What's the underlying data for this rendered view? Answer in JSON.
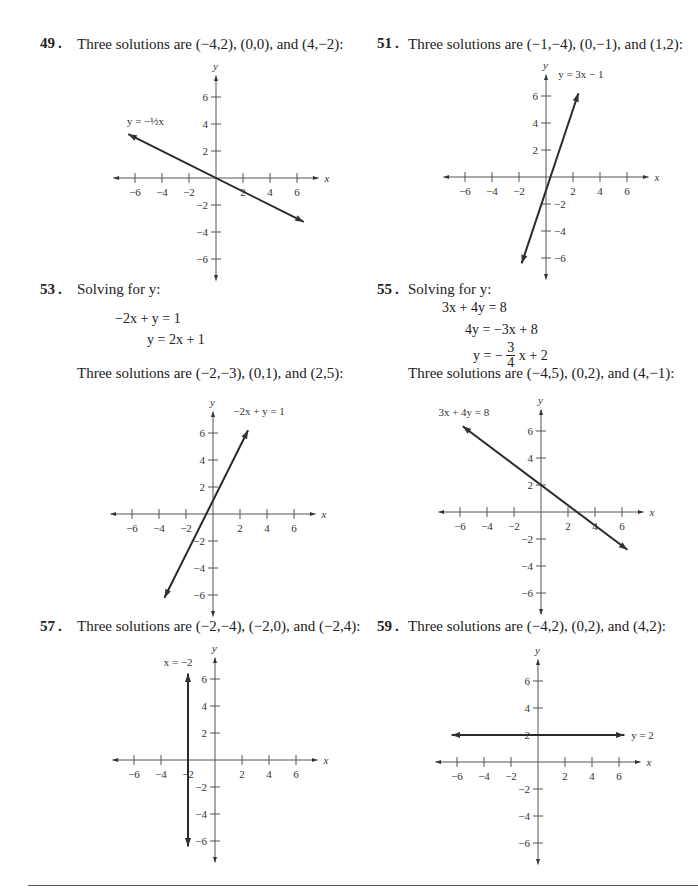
{
  "problems": [
    {
      "number": "49",
      "statement": "Three solutions are (−4,2), (0,0), and (4,−2):",
      "steps": [],
      "graph": {
        "line_label": "y = −½x",
        "equation": "y = -1/2 x",
        "points": [
          [
            -4,
            2
          ],
          [
            0,
            0
          ],
          [
            4,
            -2
          ]
        ]
      }
    },
    {
      "number": "51",
      "statement": "Three solutions are (−1,−4), (0,−1), and (1,2):",
      "steps": [],
      "graph": {
        "line_label": "y = 3x − 1",
        "equation": "y = 3x - 1",
        "points": [
          [
            -1,
            -4
          ],
          [
            0,
            -1
          ],
          [
            1,
            2
          ]
        ]
      }
    },
    {
      "number": "53",
      "intro": "Solving for y:",
      "steps": [
        "−2x + y = 1",
        "y = 2x + 1"
      ],
      "statement": "Three solutions are (−2,−3), (0,1), and (2,5):",
      "graph": {
        "line_label": "−2x + y = 1",
        "equation": "y = 2x + 1",
        "points": [
          [
            -2,
            -3
          ],
          [
            0,
            1
          ],
          [
            2,
            5
          ]
        ]
      }
    },
    {
      "number": "55",
      "intro": "Solving for y:",
      "steps": [
        "3x + 4y = 8",
        "4y = −3x + 8",
        "y = −",
        "3",
        "4",
        "x + 2"
      ],
      "statement": "Three solutions are (−4,5), (0,2), and (4,−1):",
      "graph": {
        "line_label": "3x + 4y = 8",
        "equation": "y = -3/4 x + 2",
        "points": [
          [
            -4,
            5
          ],
          [
            0,
            2
          ],
          [
            4,
            -1
          ]
        ]
      }
    },
    {
      "number": "57",
      "statement": "Three solutions are (−2,−4), (−2,0), and (−2,4):",
      "steps": [],
      "graph": {
        "line_label": "x = −2",
        "equation": "x = -2",
        "points": [
          [
            -2,
            -4
          ],
          [
            -2,
            0
          ],
          [
            -2,
            4
          ]
        ]
      }
    },
    {
      "number": "59",
      "statement": "Three solutions are (−4,2), (0,2), and (4,2):",
      "steps": [],
      "graph": {
        "line_label": "y = 2",
        "equation": "y = 2",
        "points": [
          [
            -4,
            2
          ],
          [
            0,
            2
          ],
          [
            4,
            2
          ]
        ]
      }
    }
  ],
  "axes": {
    "x_label": "x",
    "y_label": "y",
    "x_ticks": [
      "−6",
      "−4",
      "−2",
      "2",
      "4",
      "6"
    ],
    "y_ticks": [
      "6",
      "4",
      "2",
      "−2",
      "−4",
      "−6"
    ]
  },
  "chart_data": [
    {
      "type": "line",
      "title": "49",
      "series": [
        {
          "name": "y = -1/2 x",
          "x": [
            -6.5,
            6.5
          ],
          "y": [
            3.25,
            -3.25
          ]
        }
      ],
      "xlim": [
        -7,
        7
      ],
      "ylim": [
        -7,
        7
      ],
      "grid": false
    },
    {
      "type": "line",
      "title": "51",
      "series": [
        {
          "name": "y = 3x - 1",
          "x": [
            -1.8,
            2.4
          ],
          "y": [
            -6.4,
            6.2
          ]
        }
      ],
      "xlim": [
        -7,
        7
      ],
      "ylim": [
        -7,
        7
      ],
      "grid": false
    },
    {
      "type": "line",
      "title": "53",
      "series": [
        {
          "name": "-2x + y = 1",
          "x": [
            -3.6,
            2.6
          ],
          "y": [
            -6.2,
            6.2
          ]
        }
      ],
      "xlim": [
        -7,
        7
      ],
      "ylim": [
        -7,
        7
      ],
      "grid": false
    },
    {
      "type": "line",
      "title": "55",
      "series": [
        {
          "name": "3x + 4y = 8",
          "x": [
            -5.8,
            6.4
          ],
          "y": [
            6.35,
            -2.8
          ]
        }
      ],
      "xlim": [
        -7,
        7
      ],
      "ylim": [
        -7,
        7
      ],
      "grid": false
    },
    {
      "type": "line",
      "title": "57",
      "series": [
        {
          "name": "x = -2",
          "x": [
            -2,
            -2
          ],
          "y": [
            -6.4,
            6.4
          ]
        }
      ],
      "xlim": [
        -7,
        7
      ],
      "ylim": [
        -7,
        7
      ],
      "grid": false
    },
    {
      "type": "line",
      "title": "59",
      "series": [
        {
          "name": "y = 2",
          "x": [
            -6.4,
            6.4
          ],
          "y": [
            2,
            2
          ]
        }
      ],
      "xlim": [
        -7,
        7
      ],
      "ylim": [
        -7,
        7
      ],
      "grid": false
    }
  ]
}
